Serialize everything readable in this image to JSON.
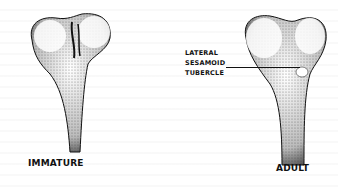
{
  "figures": [
    {
      "id": "immature",
      "label": "IMMATURE"
    },
    {
      "id": "adult",
      "label": "ADULT"
    }
  ],
  "callout": {
    "lines": [
      "LATERAL",
      "SESAMOID",
      "TUBERCLE"
    ]
  },
  "colors": {
    "ink": "#111111",
    "paper": "#ffffff",
    "stipple": "#555555"
  }
}
